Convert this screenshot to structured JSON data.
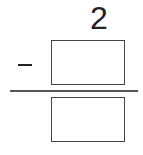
{
  "problem": {
    "top_number": "2",
    "operator": "minus",
    "subtrahend_box": {
      "value": ""
    },
    "answer_box": {
      "value": ""
    }
  }
}
